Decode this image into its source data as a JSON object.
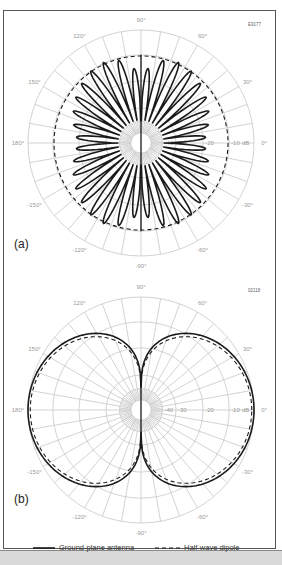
{
  "chart_data": [
    {
      "type": "polar",
      "panel_label": "(a)",
      "figure_code": "E9177",
      "angle_tick_labels": [
        "0°",
        "30°",
        "60°",
        "90°",
        "120°",
        "150°",
        "180°",
        "-150°",
        "-120°",
        "-90°",
        "-60°",
        "-30°"
      ],
      "angle_ticks_deg": [
        0,
        30,
        60,
        90,
        120,
        150,
        180,
        -150,
        -120,
        -90,
        -60,
        -30
      ],
      "radial_tick_labels": [
        "-40",
        "-30",
        "-20",
        "-10",
        "dB"
      ],
      "radial_range_db": [
        -40,
        0
      ],
      "series": [
        {
          "name": "Ground-plane antenna",
          "style": "solid",
          "description": "multi-lobed pattern, 9 lobes per quadrant, strongest near ±70°, nulls along vertical axis",
          "lobes_per_quadrant": 9,
          "peak_db": 0
        },
        {
          "name": "Half-wave dipole",
          "style": "dashed",
          "description": "near-circular reference pattern",
          "peak_db": -4
        }
      ]
    },
    {
      "type": "polar",
      "panel_label": "(b)",
      "figure_code": "02118",
      "angle_tick_labels": [
        "0°",
        "30°",
        "60°",
        "90°",
        "120°",
        "150°",
        "180°",
        "-150°",
        "-120°",
        "-90°",
        "-60°",
        "-30°"
      ],
      "angle_ticks_deg": [
        0,
        30,
        60,
        90,
        120,
        150,
        180,
        -150,
        -120,
        -90,
        -60,
        -30
      ],
      "radial_tick_labels": [
        "-40",
        "-30",
        "-20",
        "-10",
        "dB"
      ],
      "radial_range_db": [
        -40,
        0
      ],
      "series": [
        {
          "name": "Ground-plane antenna",
          "style": "solid",
          "description": "figure-eight pattern, maxima at 0° and 180°, nulls at ±90°",
          "peak_db": 0
        },
        {
          "name": "Half-wave dipole",
          "style": "dashed",
          "description": "figure-eight pattern slightly inside the ground-plane curve",
          "peak_db": -0.5
        }
      ]
    }
  ],
  "legend": {
    "items": [
      {
        "label": "Ground-plane antenna",
        "style": "solid"
      },
      {
        "label": "Half-wave dipole",
        "style": "dashed"
      }
    ],
    "placement": "bottom"
  }
}
